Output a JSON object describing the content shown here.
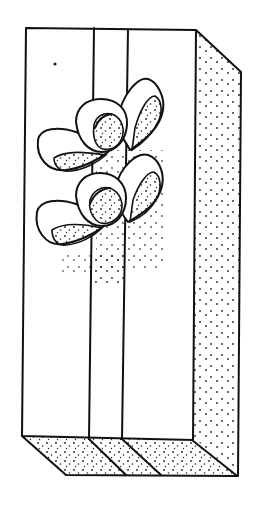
{
  "illustration": {
    "subject": "gift box with ribbon and two bows",
    "style": "black ink line drawing with stippled shading",
    "colors": {
      "ink": "#111111",
      "background": "#ffffff"
    }
  }
}
